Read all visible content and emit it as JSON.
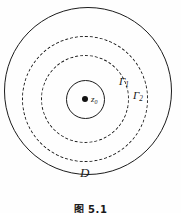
{
  "figure": {
    "caption": "图 5.1",
    "background_color": "#fefefe",
    "stroke_color": "#1c1c1c"
  },
  "labels": {
    "center_point": "z",
    "center_point_sub": "0",
    "gamma1": "Γ",
    "gamma1_sub": "1",
    "gamma2": "Γ",
    "gamma2_sub": "2",
    "domain": "D"
  },
  "diagram_data": {
    "type": "diagram",
    "description": "Concentric circles about a center point z0 inside a domain D, with two dashed contours Gamma 1 and Gamma 2",
    "center": {
      "x": 85,
      "y": 99
    },
    "shapes": [
      {
        "name": "outer-boundary",
        "role": "domain-boundary",
        "label": "D",
        "style": "solid",
        "radius": 84
      },
      {
        "name": "gamma2-circle",
        "role": "contour",
        "label": "Γ2",
        "style": "dashed",
        "radius": 63
      },
      {
        "name": "gamma1-circle",
        "role": "contour",
        "label": "Γ1",
        "style": "dashed",
        "radius": 44
      },
      {
        "name": "inner-circle",
        "role": "inner-circle",
        "label": "",
        "style": "solid",
        "radius": 19.5
      },
      {
        "name": "center-point",
        "role": "point",
        "label": "z0",
        "style": "filled-dot",
        "radius": 3
      }
    ]
  }
}
